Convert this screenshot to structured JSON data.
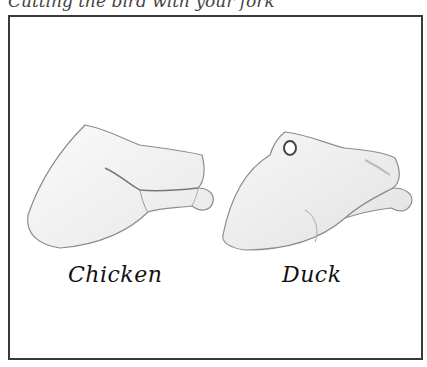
{
  "caption": "Cutting the bird with your fork",
  "figure": {
    "items": [
      {
        "label": "Chicken",
        "icon": "chicken-leg-drawing"
      },
      {
        "label": "Duck",
        "icon": "duck-leg-drawing"
      }
    ],
    "colors": {
      "border": "#3a3a3a",
      "ink": "#111111",
      "shade": "#9a9a9a"
    }
  }
}
